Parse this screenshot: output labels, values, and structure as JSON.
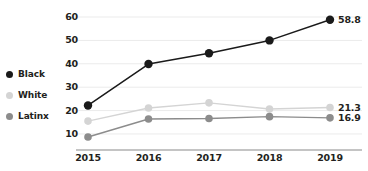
{
  "chart_data": {
    "type": "line",
    "title": "",
    "subtitle": "",
    "xlabel": "",
    "ylabel": "",
    "categories": [
      "2015",
      "2016",
      "2017",
      "2018",
      "2019"
    ],
    "yticks": [
      10,
      20,
      30,
      40,
      50,
      60
    ],
    "ylim": [
      4,
      63
    ],
    "grid": "horizontal",
    "legend_position": "left",
    "series": [
      {
        "name": "Black",
        "color": "#1a1a1a",
        "values": [
          22.2,
          39.9,
          44.5,
          50.0,
          58.8
        ],
        "end_label": "58.8"
      },
      {
        "name": "White",
        "color": "#d4d4d4",
        "values": [
          15.5,
          21.1,
          23.3,
          20.7,
          21.3
        ],
        "end_label": "21.3"
      },
      {
        "name": "Latinx",
        "color": "#8c8c8c",
        "values": [
          8.7,
          16.4,
          16.6,
          17.4,
          16.9
        ],
        "end_label": "16.9"
      }
    ]
  },
  "legend": {
    "items": [
      {
        "label": "Black",
        "color": "#1a1a1a"
      },
      {
        "label": "White",
        "color": "#d4d4d4"
      },
      {
        "label": "Latinx",
        "color": "#8c8c8c"
      }
    ]
  },
  "axes": {
    "y_tick_labels": [
      "60",
      "50",
      "40",
      "30",
      "20",
      "10"
    ],
    "x_tick_labels": [
      "2015",
      "2016",
      "2017",
      "2018",
      "2019"
    ]
  },
  "end_labels": [
    {
      "text": "58.8",
      "color": "#231f20"
    },
    {
      "text": "21.3",
      "color": "#231f20"
    },
    {
      "text": "16.9",
      "color": "#231f20"
    }
  ],
  "colors": {
    "gridline": "#ebebeb",
    "axisline": "#b0b0b0",
    "text": "#231f20",
    "background": "#ffffff"
  }
}
